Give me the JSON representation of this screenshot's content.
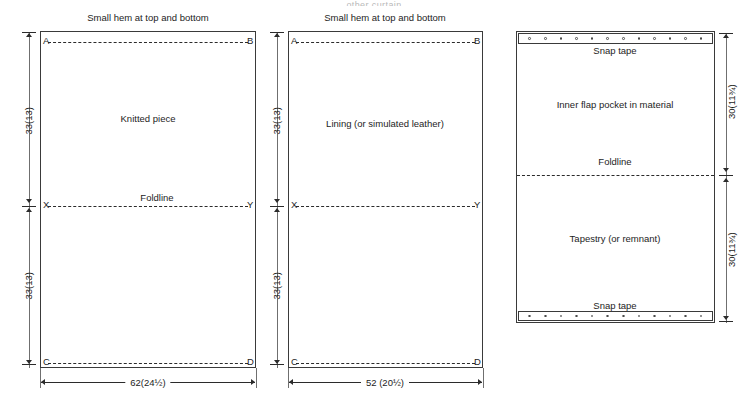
{
  "page": {
    "cropped_heading": "other  curtain"
  },
  "panels": [
    {
      "id": "knitted-piece",
      "caption_top": "Small hem at top and bottom",
      "body_label": "Knitted piece",
      "foldline_label": "Foldline",
      "corners": {
        "top_left": "A",
        "top_right": "B",
        "bottom_left": "C",
        "bottom_right": "D"
      },
      "fold_marks": {
        "left": "X",
        "right": "Y"
      },
      "dim_left_upper": "33(13)",
      "dim_left_lower": "33(13)",
      "dim_bottom": "62(24½)"
    },
    {
      "id": "lining",
      "caption_top": "Small hem at top and bottom",
      "body_label": "Lining (or simulated leather)",
      "foldline_label": "",
      "corners": {
        "top_left": "A",
        "top_right": "B",
        "bottom_left": "C",
        "bottom_right": "D"
      },
      "fold_marks": {
        "left": "X",
        "right": "Y"
      },
      "dim_left_upper": "33(13)",
      "dim_left_lower": "33(13)",
      "dim_bottom": "52 (20½)"
    },
    {
      "id": "pocket",
      "snap_tape_top": "Snap tape",
      "upper_label": "Inner flap pocket in material",
      "foldline_label": "Foldline",
      "lower_label": "Tapestry (or remnant)",
      "snap_tape_bottom": "Snap tape",
      "dim_right_upper": "30(11¾)",
      "dim_right_lower": "30(11¾)",
      "snap_dot_count": 12
    }
  ],
  "colors": {
    "line": "#3a3a3a",
    "dash": "#2b2b2b",
    "text": "#1d1d1d",
    "witness": "#6f6f6f",
    "background": "#ffffff"
  }
}
